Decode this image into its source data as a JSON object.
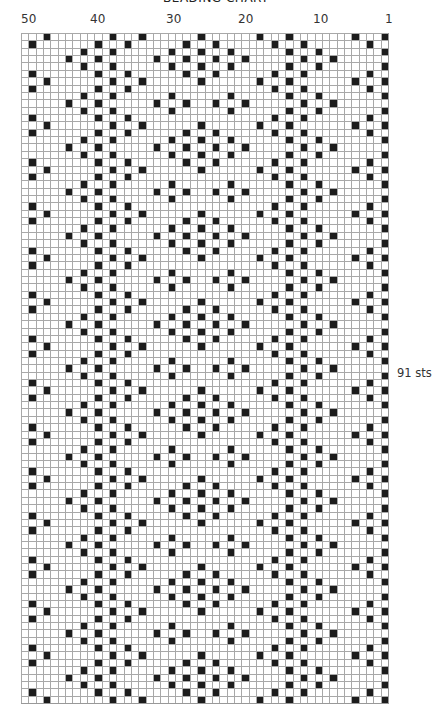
{
  "title": "BEADING CHART",
  "side_label": "91 sts",
  "column_labels": [
    {
      "text": "50",
      "x": 21
    },
    {
      "text": "40",
      "x": 90
    },
    {
      "text": "30",
      "x": 166
    },
    {
      "text": "20",
      "x": 238
    },
    {
      "text": "10",
      "x": 313
    },
    {
      "text": "1",
      "x": 385
    }
  ],
  "grid": {
    "columns": 50,
    "rows": 91,
    "column_numbering": "50 (left) to 1 (right)",
    "colors": {
      "filled": "#1c1c1c",
      "empty": "#ffffff",
      "gridline": "#a8a8a8"
    },
    "repeat_period_rows": 12,
    "repeat_unit_filled_cols_left_to_right_index": [
      [
        3,
        12,
        16,
        24,
        32,
        36,
        45,
        49
      ],
      [
        1,
        10,
        14,
        22,
        26,
        34,
        38,
        47
      ],
      [
        8,
        12,
        20,
        24,
        28,
        36,
        40,
        49
      ],
      [
        6,
        10,
        18,
        22,
        26,
        30,
        38,
        42
      ],
      [
        8,
        12,
        20,
        24,
        28,
        36,
        40,
        49
      ],
      [
        1,
        10,
        14,
        22,
        26,
        34,
        38,
        47
      ],
      [
        3,
        12,
        16,
        24,
        32,
        36,
        45,
        49
      ],
      [
        1,
        10,
        14,
        34,
        38,
        47
      ],
      [
        8,
        12,
        20,
        28,
        36,
        40,
        49
      ],
      [
        6,
        10,
        18,
        22,
        26,
        30,
        38,
        42
      ],
      [
        8,
        12,
        20,
        28,
        36,
        40,
        49
      ],
      [
        1,
        10,
        14,
        34,
        38,
        47
      ]
    ]
  }
}
